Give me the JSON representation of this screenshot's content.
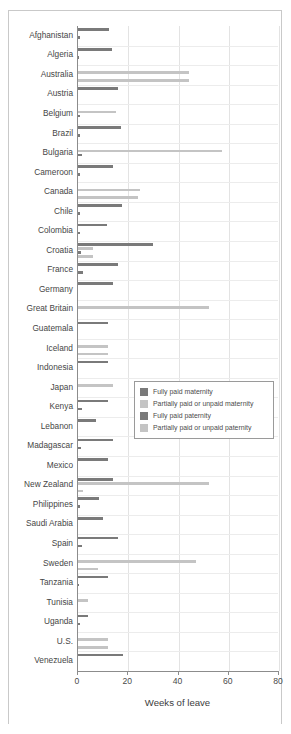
{
  "chart_data": {
    "type": "bar",
    "orientation": "horizontal",
    "title": "",
    "xlabel": "Weeks of leave",
    "ylabel": "",
    "xlim": [
      0,
      80
    ],
    "xticks": [
      0,
      20,
      40,
      60,
      80
    ],
    "grid": "vertical-and-horizontal",
    "legend_position": "center-right",
    "colors": {
      "fully_paid": "#7a7a7a",
      "partially_paid": "#c4c4c4",
      "axis": "#8c8c8c",
      "grid": "#e6e6e6",
      "text": "#4a4a4a",
      "frame": "#c9c9c9",
      "background": "#ffffff"
    },
    "series": [
      {
        "name": "Fully paid maternity",
        "color": "#7a7a7a",
        "values": [
          12.5,
          13.5,
          0,
          16,
          0,
          17,
          0,
          14,
          0,
          17.5,
          11.5,
          30,
          16,
          14,
          0,
          12,
          0,
          12,
          0,
          12,
          7,
          14,
          12,
          14,
          8.5,
          10,
          16,
          0,
          12,
          0,
          4,
          0,
          18
        ]
      },
      {
        "name": "Partially paid or unpaid maternity",
        "color": "#c4c4c4",
        "values": [
          0,
          0,
          44,
          0,
          15,
          0,
          57.5,
          0,
          24.5,
          0,
          0,
          6,
          0,
          0,
          52,
          0,
          12,
          0,
          14,
          0,
          0,
          0,
          0,
          52,
          0,
          0,
          0,
          47,
          0,
          4,
          0,
          12,
          0
        ]
      },
      {
        "name": "Fully paid paternity",
        "color": "#7a7a7a",
        "values": [
          0.6,
          0.4,
          0,
          0,
          0.6,
          0.6,
          1.6,
          0.8,
          0,
          0.8,
          0.6,
          1.2,
          1.8,
          0,
          0,
          0,
          0,
          0,
          0,
          1.6,
          0,
          1.2,
          0,
          0,
          0.8,
          0,
          1.6,
          0,
          0.4,
          0,
          0.6,
          0,
          0
        ]
      },
      {
        "name": "Partially paid or unpaid paternity",
        "color": "#c4c4c4",
        "values": [
          0,
          0,
          44,
          0,
          0,
          0,
          0,
          0,
          24,
          0,
          0,
          6,
          0,
          0,
          0,
          0,
          12,
          0,
          0,
          0,
          0,
          0,
          0,
          2,
          0,
          0,
          0,
          8,
          0,
          0,
          0,
          12,
          0
        ]
      }
    ],
    "categories": [
      "Afghanistan",
      "Algeria",
      "Australia",
      "Austria",
      "Belgium",
      "Brazil",
      "Bulgaria",
      "Cameroon",
      "Canada",
      "Chile",
      "Colombia",
      "Croatia",
      "France",
      "Germany",
      "Great Britain",
      "Guatemala",
      "Iceland",
      "Indonesia",
      "Japan",
      "Kenya",
      "Lebanon",
      "Madagascar",
      "Mexico",
      "New Zealand",
      "Philippines",
      "Saudi Arabia",
      "Spain",
      "Sweden",
      "Tanzania",
      "Tunisia",
      "Uganda",
      "U.S.",
      "Venezuela"
    ]
  },
  "legend": {
    "items": [
      {
        "label": "Fully paid maternity",
        "color": "#7a7a7a"
      },
      {
        "label": "Partially paid or unpaid maternity",
        "color": "#c4c4c4"
      },
      {
        "label": "Fully paid paternity",
        "color": "#7a7a7a"
      },
      {
        "label": "Partially paid or unpaid paternity",
        "color": "#c4c4c4"
      }
    ]
  }
}
